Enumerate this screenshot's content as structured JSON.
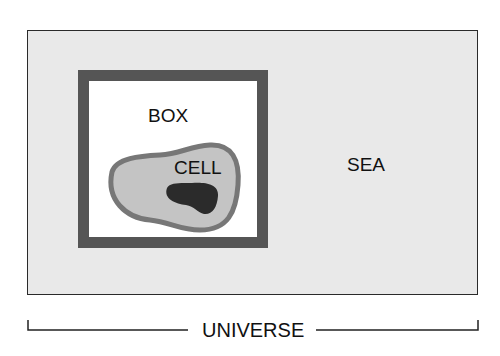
{
  "diagram": {
    "type": "nested-regions",
    "regions": [
      {
        "id": "universe",
        "label": "UNIVERSE"
      },
      {
        "id": "sea",
        "label": "SEA",
        "fill": "#e9e9e9"
      },
      {
        "id": "box",
        "label": "BOX",
        "fill": "#ffffff",
        "border": "#555555"
      },
      {
        "id": "cell",
        "label": "CELL",
        "fill": "#c4c4c4",
        "border": "#777777"
      },
      {
        "id": "nucleus",
        "label": "",
        "fill": "#2b2b2b"
      }
    ]
  },
  "labels": {
    "universe": "UNIVERSE",
    "sea": "SEA",
    "box": "BOX",
    "cell": "CELL"
  }
}
